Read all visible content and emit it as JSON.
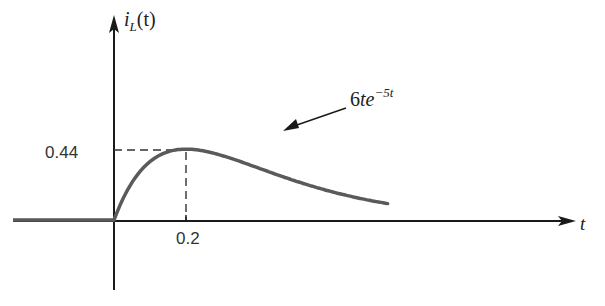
{
  "chart_data": {
    "type": "line",
    "title": "",
    "xlabel": "t",
    "ylabel": "i_L(t)",
    "ylabel_parts": {
      "base": "i",
      "sub": "L",
      "rest": "(t)"
    },
    "function": "6te^{-5t}",
    "curve_label": {
      "coef": "6",
      "var": "te",
      "exp": "−5t"
    },
    "annotations": {
      "peak_value_label": "0.44",
      "peak_time_label": "0.2"
    },
    "peak": {
      "t": 0.2,
      "i": 0.44
    },
    "x": [
      -0.28,
      0,
      0.05,
      0.1,
      0.15,
      0.2,
      0.25,
      0.3,
      0.35,
      0.4,
      0.45,
      0.5,
      0.55,
      0.6,
      0.65,
      0.7,
      0.76
    ],
    "values": [
      0,
      0,
      0.234,
      0.364,
      0.425,
      0.441,
      0.43,
      0.402,
      0.363,
      0.325,
      0.284,
      0.246,
      0.211,
      0.179,
      0.151,
      0.127,
      0.1
    ],
    "xlim": [
      -0.28,
      1.28
    ],
    "ylim": [
      -0.43,
      1.25
    ],
    "grid": false,
    "legend": "none"
  },
  "colors": {
    "axis": "#1a1a1a",
    "curve": "#5a5a5a",
    "dashed": "#333333",
    "text": "#222222"
  }
}
